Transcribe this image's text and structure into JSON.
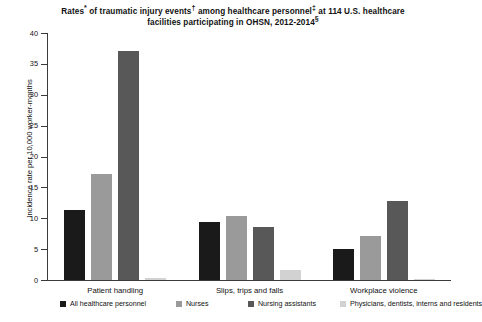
{
  "chart_data": {
    "type": "bar",
    "title_lines": [
      {
        "segments": [
          {
            "text": "Rates",
            "sup": "*"
          },
          {
            "text": " of traumatic injury events",
            "sup": "†"
          },
          {
            "text": " among healthcare personnel",
            "sup": "‡"
          },
          {
            "text": " at 114 U.S. healthcare",
            "sup": ""
          }
        ]
      },
      {
        "segments": [
          {
            "text": "facilities participating in OHSN, 2012-2014",
            "sup": "§"
          }
        ]
      }
    ],
    "xlabel": "",
    "ylabel": "Incidence rate per 10,000 worker-months",
    "ylim": [
      0,
      40
    ],
    "ytick_step": 5,
    "yticks": [
      0,
      5,
      10,
      15,
      20,
      25,
      30,
      35,
      40
    ],
    "ytick_labels": [
      "0",
      "5",
      "10",
      "15",
      "20",
      "25",
      "30",
      "35",
      "40"
    ],
    "grid": false,
    "legend_position": "bottom",
    "categories": [
      "Patient handling",
      "Slips, trips and falls",
      "Workplace violence"
    ],
    "series": [
      {
        "name": "All healthcare personnel",
        "color": "#1a1a1a",
        "values": [
          11.3,
          9.4,
          5.0
        ]
      },
      {
        "name": "Nurses",
        "color": "#9a9a9a",
        "values": [
          17.2,
          10.3,
          7.2
        ]
      },
      {
        "name": "Nursing assistants",
        "color": "#585858",
        "values": [
          37.1,
          8.6,
          12.8
        ]
      },
      {
        "name": "Physicians, dentists, interns and residents",
        "color": "#d2d2d2",
        "values": [
          0.3,
          1.6,
          0.2
        ]
      }
    ]
  }
}
